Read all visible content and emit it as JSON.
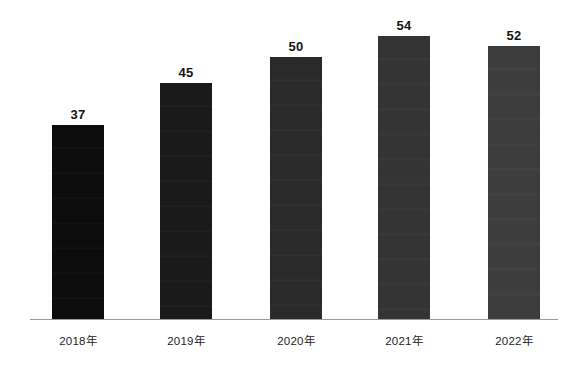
{
  "chart_data": {
    "type": "bar",
    "title": "",
    "subtitle": "",
    "xlabel": "",
    "ylabel": "",
    "categories": [
      "2018年",
      "2019年",
      "2020年",
      "2021年",
      "2022年"
    ],
    "values": [
      37,
      45,
      50,
      54,
      52
    ],
    "value_labels": [
      "37",
      "45",
      "50",
      "54",
      "52"
    ],
    "ylim": [
      0,
      60
    ],
    "grid": false,
    "legend": null,
    "legend_position": "none",
    "y_axis_visible": false,
    "x_axis_visible": true,
    "annotations": [],
    "series": [
      {
        "name": "",
        "values": [
          37,
          45,
          50,
          54,
          52
        ]
      }
    ],
    "bar_colors": [
      "#0c0c0c",
      "#1a1a1a",
      "#2a2a2a",
      "#343434",
      "#3d3d3d"
    ],
    "axis_color": "#9a9a9a",
    "label_color": "#141414",
    "tick_color": "#1d1d1d",
    "background_color": "#ffffff"
  }
}
